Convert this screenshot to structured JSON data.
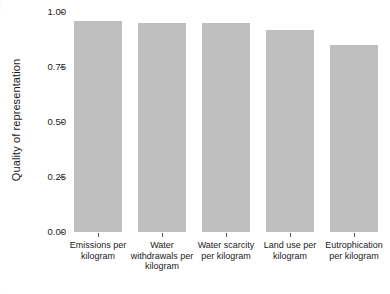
{
  "chart_data": {
    "type": "bar",
    "title": "",
    "xlabel": "",
    "ylabel": "Quality of representation",
    "categories": [
      "Emissions per kilogram",
      "Water withdrawals per kilogram",
      "Water scarcity per kilogram",
      "Land use per kilogram",
      "Eutrophication per kilogram"
    ],
    "values": [
      0.96,
      0.95,
      0.95,
      0.92,
      0.85
    ],
    "ylim": [
      0.0,
      1.0
    ],
    "yticks": [
      "0.00",
      "0.25",
      "0.50",
      "0.75",
      "1.00"
    ],
    "ytick_values": [
      0.0,
      0.25,
      0.5,
      0.75,
      1.0
    ],
    "grid": false,
    "legend": "none",
    "bar_color": "#bfbfbf",
    "axis_color": "#555555",
    "text_color": "#1a1a1a",
    "background": "#ffffff"
  }
}
